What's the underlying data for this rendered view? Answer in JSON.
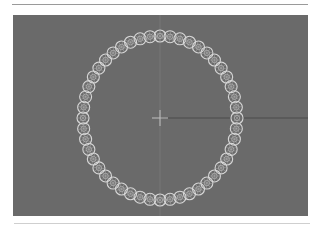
{
  "viewport": {
    "background": "#6a6a6a",
    "ring": {
      "center": [
        147,
        103
      ],
      "radius_x": 77,
      "radius_y": 82,
      "bead_count": 48,
      "bead_radius": 6,
      "bead_color": "#d8d8d8"
    },
    "crosshair": {
      "position": [
        147,
        103
      ],
      "color": "#b8b8b8"
    },
    "axis_line": {
      "color": "#4a4a4a"
    }
  }
}
